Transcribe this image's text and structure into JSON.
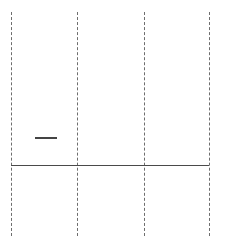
{
  "diagram": {
    "type": "timeline-grid",
    "gridlines": [
      {
        "x": 11,
        "style": "dashed"
      },
      {
        "x": 77,
        "style": "dashed"
      },
      {
        "x": 144,
        "style": "dashed"
      },
      {
        "x": 209,
        "style": "dashed"
      }
    ],
    "baseline": {
      "x1": 11,
      "x2": 209,
      "y": 166,
      "style": "solid"
    },
    "marker": {
      "x1": 35,
      "x2": 57,
      "y": 138,
      "style": "solid"
    },
    "colors": {
      "line": "#4a4a4a",
      "grid": "#6e6e6e",
      "background": "#ffffff"
    }
  }
}
